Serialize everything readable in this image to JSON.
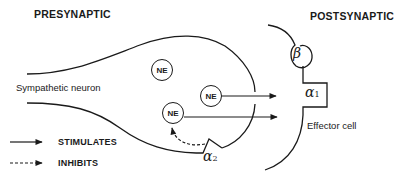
{
  "labels": {
    "presynaptic": "PRESYNAPTIC",
    "postsynaptic": "POSTSYNAPTIC",
    "neuron": "Sympathetic neuron",
    "effector": "Effector cell"
  },
  "vesicles": [
    {
      "label": "NE",
      "x": 151,
      "y": 59
    },
    {
      "label": "NE",
      "x": 200,
      "y": 85
    },
    {
      "label": "NE",
      "x": 162,
      "y": 102
    }
  ],
  "receptors": {
    "beta": {
      "symbol": "β",
      "sub": ""
    },
    "alpha1": {
      "symbol": "α",
      "sub": "1"
    },
    "alpha2": {
      "symbol": "α",
      "sub": "2"
    }
  },
  "legend": {
    "stimulates": "STIMULATES",
    "inhibits": "INHIBITS"
  },
  "colors": {
    "line": "#1a1a1a",
    "background": "#ffffff"
  }
}
